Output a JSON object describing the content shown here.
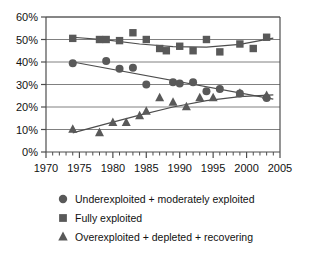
{
  "chart_data": {
    "type": "scatter",
    "title": "",
    "subtitle": "",
    "xlabel": "",
    "ylabel": "",
    "xlim": [
      1970,
      2005
    ],
    "ylim": [
      0,
      60
    ],
    "grid": true,
    "grid_axis": "y",
    "legend_position": "bottom",
    "x_ticks": [
      1970,
      1975,
      1980,
      1985,
      1990,
      1995,
      2000,
      2005
    ],
    "x_tick_labels": [
      "1970",
      "1975",
      "1980",
      "1985",
      "1990",
      "1995",
      "2000",
      "2005"
    ],
    "x_minor_tick_interval": 1,
    "y_ticks": [
      0,
      10,
      20,
      30,
      40,
      50,
      60
    ],
    "y_tick_labels": [
      "0%",
      "10%",
      "20%",
      "30%",
      "40%",
      "50%",
      "60%"
    ],
    "marker_color": "#595959",
    "line_color": "#4d4d4d",
    "axis_color": "#4d4d4d",
    "grid_color": "#808080",
    "series": [
      {
        "name": "Underexploited + moderately exploited",
        "marker": "circle",
        "points": [
          [
            1974,
            39.5
          ],
          [
            1979,
            40.5
          ],
          [
            1981,
            37.0
          ],
          [
            1983,
            37.5
          ],
          [
            1985,
            30.0
          ],
          [
            1989,
            31.0
          ],
          [
            1990,
            30.5
          ],
          [
            1992,
            31.0
          ],
          [
            1994,
            27.0
          ],
          [
            1996,
            28.0
          ],
          [
            1999,
            26.0
          ],
          [
            2003,
            24.0
          ]
        ],
        "trend": [
          [
            1974,
            40.0
          ],
          [
            2004,
            23.5
          ]
        ]
      },
      {
        "name": "Fully exploited",
        "marker": "square",
        "points": [
          [
            1974,
            50.5
          ],
          [
            1978,
            50.0
          ],
          [
            1979,
            50.0
          ],
          [
            1981,
            49.5
          ],
          [
            1983,
            53.0
          ],
          [
            1985,
            50.0
          ],
          [
            1987,
            46.0
          ],
          [
            1988,
            45.0
          ],
          [
            1990,
            47.0
          ],
          [
            1992,
            45.0
          ],
          [
            1994,
            50.0
          ],
          [
            1996,
            44.5
          ],
          [
            1999,
            48.0
          ],
          [
            2001,
            46.0
          ],
          [
            2003,
            51.0
          ]
        ],
        "trend": [
          [
            1974,
            51.0
          ],
          [
            1979,
            49.8
          ],
          [
            1984,
            48.0
          ],
          [
            1989,
            46.8
          ],
          [
            1994,
            46.6
          ],
          [
            1999,
            47.8
          ],
          [
            2004,
            50.6
          ]
        ]
      },
      {
        "name": "Overexploited + depleted + recovering",
        "marker": "triangle",
        "points": [
          [
            1974,
            10.0
          ],
          [
            1978,
            8.5
          ],
          [
            1980,
            13.0
          ],
          [
            1982,
            13.0
          ],
          [
            1984,
            16.0
          ],
          [
            1985,
            18.0
          ],
          [
            1987,
            24.0
          ],
          [
            1989,
            22.0
          ],
          [
            1991,
            20.0
          ],
          [
            1993,
            24.0
          ],
          [
            1995,
            24.0
          ],
          [
            1999,
            26.0
          ],
          [
            2003,
            25.0
          ]
        ],
        "trend": [
          [
            1974,
            8.5
          ],
          [
            1979,
            12.5
          ],
          [
            1984,
            16.4
          ],
          [
            1989,
            20.0
          ],
          [
            1994,
            22.8
          ],
          [
            1999,
            24.6
          ],
          [
            2004,
            25.4
          ]
        ]
      }
    ],
    "legend_entries": [
      {
        "marker": "circle",
        "label": "Underexploited + moderately exploited"
      },
      {
        "marker": "square",
        "label": "Fully exploited"
      },
      {
        "marker": "triangle",
        "label": "Overexploited + depleted + recovering"
      }
    ]
  },
  "axis": {
    "y_label_0": "0%",
    "y_label_10": "10%",
    "y_label_20": "20%",
    "y_label_30": "30%",
    "y_label_40": "40%",
    "y_label_50": "50%",
    "y_label_60": "60%",
    "x_label_1970": "1970",
    "x_label_1975": "1975",
    "x_label_1980": "1980",
    "x_label_1985": "1985",
    "x_label_1990": "1990",
    "x_label_1995": "1995",
    "x_label_2000": "2000",
    "x_label_2005": "2005"
  },
  "legend": {
    "item_1": "Underexploited + moderately exploited",
    "item_2": "Fully exploited",
    "item_3": "Overexploited + depleted + recovering"
  }
}
